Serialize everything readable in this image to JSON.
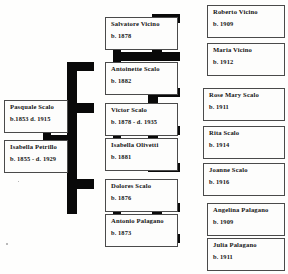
{
  "chart": {
    "type": "family-tree",
    "generations": 3
  },
  "people": {
    "pasquale_scalo": {
      "name": "Pasquale Scalo",
      "dates": "b.1853   d. 1915"
    },
    "isabella_petrillo": {
      "name": "Isabella Petrillo",
      "dates": "b. 1855 - d. 1929"
    },
    "salvatore_vicino": {
      "name": "Salvatore Vicino",
      "dates": "b. 1878"
    },
    "antoinette_scalo": {
      "name": "Antoinette Scalo",
      "dates": "b. 1882"
    },
    "victor_scalo": {
      "name": "Victor Scalo",
      "dates": "b. 1878 - d. 1935"
    },
    "isabella_olivetti": {
      "name": "Isabella Olivetti",
      "dates": "b. 1881"
    },
    "dolores_scalo": {
      "name": "Dolores Scalo",
      "dates": "b. 1876"
    },
    "antonio_palagano": {
      "name": "Antonio Palagano",
      "dates": "b. 1873"
    },
    "roberto_vicino": {
      "name": "Roberto Vicino",
      "dates": "b. 1909"
    },
    "maria_vicino": {
      "name": "Maria Vicino",
      "dates": "b. 1912"
    },
    "rose_mary_scalo": {
      "name": "Rose Mary Scalo",
      "dates": "b. 1911"
    },
    "rita_scalo": {
      "name": "Rita Scalo",
      "dates": "b. 1914"
    },
    "joanne_scalo": {
      "name": "Joanne Scalo",
      "dates": "b. 1916"
    },
    "angelina_palagano": {
      "name": "Angelina Palagano",
      "dates": "b. 1909"
    },
    "julia_palagano": {
      "name": "Julia Palagano",
      "dates": "b. 1911"
    }
  }
}
